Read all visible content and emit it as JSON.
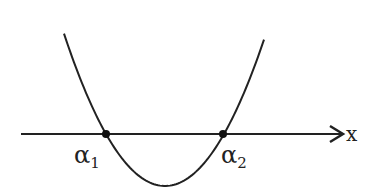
{
  "diagram": {
    "axis": {
      "label": "x",
      "direction": "right-arrow"
    },
    "curve": {
      "type": "parabola",
      "opens": "up"
    },
    "roots": [
      {
        "symbol": "α",
        "subscript": "1"
      },
      {
        "symbol": "α",
        "subscript": "2"
      }
    ],
    "colors": {
      "stroke": "#222222",
      "background": "#ffffff"
    }
  }
}
